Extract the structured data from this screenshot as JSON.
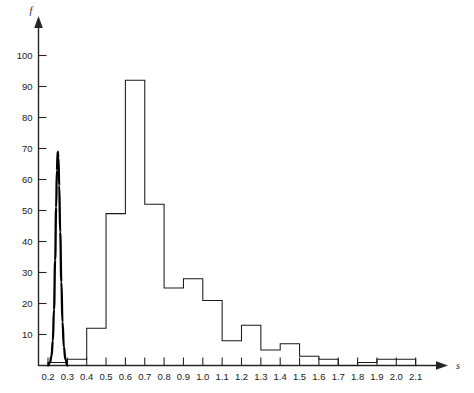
{
  "chart_data": {
    "type": "bar",
    "title": "",
    "subtitle": "",
    "xlabel": "s",
    "ylabel": "f",
    "xlim": [
      0.15,
      2.2
    ],
    "ylim": [
      0,
      107
    ],
    "grid": false,
    "legend": null,
    "bin_width": 0.1,
    "x_tick_labels": [
      "0.2",
      "0.3",
      "0.4",
      "0.5",
      "0.6",
      "0.7",
      "0.8",
      "0.9",
      "1.0",
      "1.1",
      "1.2",
      "1.3",
      "1.4",
      "1.5",
      "1.6",
      "1.7",
      "1.8",
      "1.9",
      "2.0",
      "2.1"
    ],
    "x_tick_values": [
      0.2,
      0.3,
      0.4,
      0.5,
      0.6,
      0.7,
      0.8,
      0.9,
      1.0,
      1.1,
      1.2,
      1.3,
      1.4,
      1.5,
      1.6,
      1.7,
      1.8,
      1.9,
      2.0,
      2.1
    ],
    "y_tick_labels": [
      "10",
      "20",
      "30",
      "40",
      "50",
      "60",
      "70",
      "80",
      "90",
      "100"
    ],
    "y_tick_values": [
      10,
      20,
      30,
      40,
      50,
      60,
      70,
      80,
      90,
      100
    ],
    "bin_edges": [
      0.2,
      0.3,
      0.4,
      0.5,
      0.6,
      0.7,
      0.8,
      0.9,
      1.0,
      1.1,
      1.2,
      1.3,
      1.4,
      1.5,
      1.6,
      1.7,
      1.8,
      1.9,
      2.0,
      2.1
    ],
    "categories": [
      "0.2-0.3",
      "0.3-0.4",
      "0.4-0.5",
      "0.5-0.6",
      "0.6-0.7",
      "0.7-0.8",
      "0.8-0.9",
      "0.9-1.0",
      "1.0-1.1",
      "1.1-1.2",
      "1.2-1.3",
      "1.3-1.4",
      "1.4-1.5",
      "1.5-1.6",
      "1.6-1.7",
      "1.7-1.8",
      "1.8-1.9",
      "1.9-2.0",
      "2.0-2.1"
    ],
    "values": [
      1,
      2,
      12,
      49,
      92,
      52,
      25,
      28,
      21,
      8,
      13,
      5,
      7,
      3,
      2,
      0,
      1,
      2,
      2
    ],
    "series": [
      {
        "name": "histogram",
        "values": [
          1,
          2,
          12,
          49,
          92,
          52,
          25,
          28,
          21,
          8,
          13,
          5,
          7,
          3,
          2,
          0,
          1,
          2,
          2
        ]
      },
      {
        "name": "overlay-curve",
        "type": "line",
        "peak_x": 0.25,
        "peak_y": 69,
        "x": [
          0.2,
          0.21,
          0.218,
          0.225,
          0.231,
          0.237,
          0.242,
          0.246,
          0.25,
          0.254,
          0.258,
          0.263,
          0.269,
          0.275,
          0.282,
          0.29,
          0.3
        ],
        "y": [
          0,
          1,
          3,
          8,
          18,
          34,
          51,
          63,
          69,
          67,
          58,
          43,
          27,
          14,
          6,
          2,
          0
        ]
      }
    ]
  }
}
